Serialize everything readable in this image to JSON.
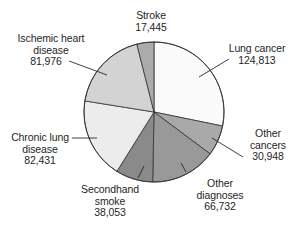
{
  "chart_data": {
    "type": "pie",
    "title": "",
    "start_angle_deg": 0,
    "direction": "clockwise",
    "center": [
      154,
      112
    ],
    "radius": 70,
    "slices": [
      {
        "label": "Lung cancer",
        "value": 124813,
        "value_text": "124,813",
        "color": "#fafafa"
      },
      {
        "label": "Other cancers",
        "value": 30948,
        "value_text": "30,948",
        "color": "#a9a9a9"
      },
      {
        "label": "Other diagnoses",
        "value": 66732,
        "value_text": "66,732",
        "color": "#999999"
      },
      {
        "label": "Secondhand smoke",
        "value": 38053,
        "value_text": "38,053",
        "color": "#8a8a8a"
      },
      {
        "label": "Chronic lung disease",
        "value": 82431,
        "value_text": "82,431",
        "color": "#ececec"
      },
      {
        "label": "Ischemic heart disease",
        "value": 81976,
        "value_text": "81,976",
        "color": "#d3d3d3"
      },
      {
        "label": "Stroke",
        "value": 17445,
        "value_text": "17,445",
        "color": "#ababab"
      }
    ],
    "legend": "none (direct labels with leader lines)"
  },
  "labels": {
    "lung_cancer": {
      "line1": "Lung cancer",
      "line2": "124,813"
    },
    "other_cancers": {
      "line1": "Other",
      "line2": "cancers",
      "line3": "30,948"
    },
    "other_diagnoses": {
      "line1": "Other",
      "line2": "diagnoses",
      "line3": "66,732"
    },
    "secondhand_smoke": {
      "line1": "Secondhand",
      "line2": "smoke",
      "line3": "38,053"
    },
    "chronic_lung": {
      "line1": "Chronic lung",
      "line2": "disease",
      "line3": "82,431"
    },
    "ischemic_heart": {
      "line1": "Ischemic heart",
      "line2": "disease",
      "line3": "81,976"
    },
    "stroke": {
      "line1": "Stroke",
      "line2": "17,445"
    }
  }
}
